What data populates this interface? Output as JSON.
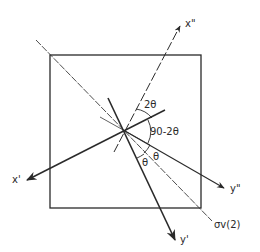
{
  "diagram": {
    "type": "axis-rotation-geometry",
    "axes": [
      {
        "id": "x_double_prime",
        "label": "x\"",
        "style": "dashed"
      },
      {
        "id": "y_double_prime",
        "label": "y\"",
        "style": "solid-thin"
      },
      {
        "id": "x_prime",
        "label": "x'",
        "style": "solid-thick"
      },
      {
        "id": "y_prime",
        "label": "y'",
        "style": "solid-thick"
      }
    ],
    "plane_label": "σv(2)",
    "angle_labels": {
      "two_theta": "2θ",
      "ninety_minus_two_theta": "90-2θ",
      "theta_upper": "θ",
      "theta_lower": "θ"
    },
    "colors": {
      "line": "#2a2a2a",
      "background": "#ffffff"
    }
  }
}
